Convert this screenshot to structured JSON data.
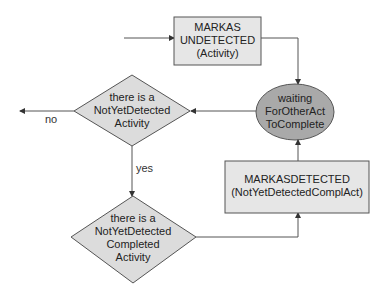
{
  "colors": {
    "box_fill": "#e6e6e6",
    "diamond_fill": "#dcdcdc",
    "ellipse_fill": "#a9a9a9",
    "stroke": "#555555"
  },
  "nodes": {
    "mark_undetected": {
      "line1": "MARKAS",
      "line2": "UNDETECTED",
      "line3": "(Activity)"
    },
    "waiting": {
      "line1": "waiting",
      "line2": "ForOtherAct",
      "line3": "ToComplete"
    },
    "decision_not_yet_detected": {
      "line1": "there is a",
      "line2": "NotYetDetected",
      "line3": "Activity"
    },
    "decision_completed": {
      "line1": "there is a",
      "line2": "NotYetDetected",
      "line3": "Completed",
      "line4": "Activity"
    },
    "mark_detected": {
      "line1": "MARKASDETECTED",
      "line2": "(NotYetDetectedComplAct)"
    }
  },
  "edges": {
    "no_label": "no",
    "yes_label": "yes"
  }
}
